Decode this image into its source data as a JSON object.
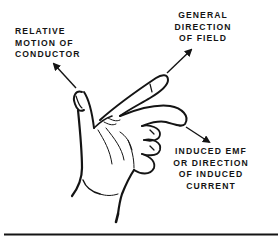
{
  "diagram": {
    "labels": {
      "motion": [
        "RELATIVE",
        "MOTION OF",
        "CONDUCTOR"
      ],
      "field": [
        "GENERAL",
        "DIRECTION",
        "OF FIELD"
      ],
      "emf": [
        "INDUCED EMF",
        "OR DIRECTION",
        "OF INDUCED",
        "CURRENT"
      ]
    },
    "arrows": [
      {
        "name": "motion-arrow",
        "from": [
          76,
          88
        ],
        "to": [
          52,
          62
        ],
        "points_to": "thumb direction"
      },
      {
        "name": "field-arrow",
        "from": [
          168,
          72
        ],
        "to": [
          193,
          48
        ],
        "points_to": "index finger direction"
      },
      {
        "name": "emf-arrow",
        "from": [
          186,
          127
        ],
        "to": [
          211,
          143
        ],
        "points_to": "middle finger direction"
      }
    ],
    "colors": {
      "ink": "#141414",
      "background": "#ffffff"
    }
  }
}
